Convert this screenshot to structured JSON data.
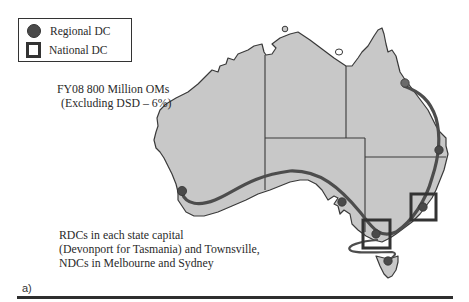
{
  "legend": {
    "items": [
      {
        "icon": "filled-circle",
        "label": "Regional DC"
      },
      {
        "icon": "hollow-square",
        "label": "National DC"
      }
    ]
  },
  "annotations": {
    "volume_line1": "FY08 800 Million OMs",
    "volume_line2": "(Excluding DSD – 6%)",
    "network_line1": "RDCs in each state capital",
    "network_line2": "(Devonport for Tasmania) and Townsville,",
    "network_line3": "NDCs in Melbourne and Sydney"
  },
  "panel_label": "a)",
  "map": {
    "region": "Australia",
    "states": [
      "WA",
      "NT",
      "SA",
      "QLD",
      "NSW",
      "VIC",
      "TAS"
    ],
    "regional_dcs": [
      "Perth",
      "Adelaide",
      "Melbourne",
      "Sydney",
      "Brisbane",
      "Townsville",
      "Devonport"
    ],
    "national_dcs": [
      "Melbourne",
      "Sydney"
    ],
    "colors": {
      "land": "#c8c8c8",
      "border": "#3a3a3a",
      "route": "#4d4d4d",
      "dc_marker": "#4a4a4a",
      "ndc_box": "#333333"
    }
  }
}
